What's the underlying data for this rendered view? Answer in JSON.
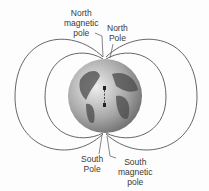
{
  "diagram": {
    "labels": {
      "north_magnetic_pole": [
        "North",
        "magnetic",
        "pole"
      ],
      "north_pole": [
        "North",
        "Pole"
      ],
      "south_pole": [
        "South",
        "Pole"
      ],
      "south_magnetic_pole": [
        "South",
        "magnetic",
        "pole"
      ]
    },
    "magnet": {
      "top": "S",
      "bottom": "N"
    },
    "colors": {
      "field_lines": "#555555",
      "globe_light": "#d8d8d8",
      "globe_dark": "#6f6f6f",
      "land": "#4a4a4a",
      "text": "#3a3a3a"
    }
  }
}
